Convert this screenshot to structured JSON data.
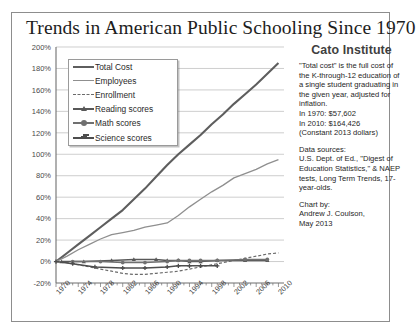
{
  "title": "Trends in American Public Schooling Since 1970",
  "sidebar": {
    "org": "Cato Institute",
    "definition": "\"Total cost\" is the full cost of the K-through-12 education of a single student graduating in the given year, adjusted for inflation.",
    "cost_1970": "In 1970:   $57,602",
    "cost_2010": "In 2010:  $164,426",
    "constant_note": "(Constant 2013 dollars)",
    "sources_label": "Data sources:",
    "sources_text": "U.S. Dept. of Ed., \"Digest of Education Statistics,\" & NAEP tests, Long Term Trends, 17-year-olds.",
    "chartby_label": "Chart by:",
    "author": "Andrew J. Coulson,",
    "date": "May 2013"
  },
  "chart_data": {
    "type": "line",
    "title": "Trends in American Public Schooling Since 1970",
    "xlabel": "",
    "ylabel": "",
    "xlim": [
      1970,
      2011
    ],
    "ylim": [
      -20,
      200
    ],
    "ytick_step": 20,
    "grid": true,
    "legend_position": "upper-left-inside",
    "ytick_labels": [
      "200%",
      "180%",
      "160%",
      "140%",
      "120%",
      "100%",
      "80%",
      "60%",
      "40%",
      "20%",
      "0%",
      "-20%"
    ],
    "ytick_values": [
      200,
      180,
      160,
      140,
      120,
      100,
      80,
      60,
      40,
      20,
      0,
      -20
    ],
    "xtick_labels": [
      "1970",
      "1974",
      "1978",
      "1982",
      "1986",
      "1990",
      "1994",
      "1998",
      "2002",
      "2006",
      "2010"
    ],
    "xtick_values": [
      1970,
      1974,
      1978,
      1982,
      1986,
      1990,
      1994,
      1998,
      2002,
      2006,
      2010
    ],
    "series": [
      {
        "name": "Total Cost",
        "color": "#5e5e5e",
        "width": 2.1,
        "dash": "",
        "marker": "none",
        "x": [
          1970,
          1972,
          1974,
          1976,
          1978,
          1980,
          1982,
          1984,
          1986,
          1988,
          1990,
          1992,
          1994,
          1996,
          1998,
          2000,
          2002,
          2004,
          2006,
          2008,
          2010
        ],
        "values": [
          0,
          8,
          16,
          24,
          32,
          40,
          48,
          58,
          68,
          79,
          90,
          100,
          109,
          118,
          128,
          137,
          147,
          156,
          165,
          175,
          185
        ]
      },
      {
        "name": "Employees",
        "color": "#8f8f8f",
        "width": 1.3,
        "dash": "",
        "marker": "none",
        "x": [
          1970,
          1972,
          1974,
          1976,
          1978,
          1980,
          1982,
          1984,
          1986,
          1988,
          1990,
          1992,
          1994,
          1996,
          1998,
          2000,
          2002,
          2004,
          2006,
          2008,
          2010
        ],
        "values": [
          0,
          5,
          11,
          16,
          21,
          25,
          27,
          29,
          32,
          34,
          36,
          43,
          51,
          58,
          65,
          71,
          78,
          82,
          86,
          91,
          95
        ]
      },
      {
        "name": "Enrollment",
        "color": "#6a6a6a",
        "width": 1.2,
        "dash": "3,2",
        "marker": "none",
        "x": [
          1970,
          1972,
          1974,
          1976,
          1978,
          1980,
          1982,
          1984,
          1986,
          1988,
          1990,
          1992,
          1994,
          1996,
          1998,
          2000,
          2002,
          2004,
          2006,
          2008,
          2010
        ],
        "values": [
          0,
          -1,
          -3,
          -5,
          -7,
          -9,
          -11,
          -12,
          -12,
          -11,
          -10,
          -9,
          -7,
          -5,
          -3,
          -1,
          1,
          3,
          5,
          7,
          8
        ]
      },
      {
        "name": "Reading scores",
        "color": "#585858",
        "width": 1.5,
        "dash": "",
        "marker": "triangle",
        "x": [
          1971,
          1975,
          1980,
          1984,
          1988,
          1990,
          1992,
          1994,
          1996,
          1999,
          2004,
          2008
        ],
        "values": [
          0,
          0,
          1,
          2,
          2,
          1,
          1,
          0,
          0,
          1,
          1,
          1
        ]
      },
      {
        "name": "Math scores",
        "color": "#707070",
        "width": 1.5,
        "dash": "",
        "marker": "circle",
        "x": [
          1973,
          1978,
          1982,
          1986,
          1990,
          1992,
          1994,
          1996,
          1999,
          2004,
          2008
        ],
        "values": [
          0,
          0,
          -1,
          -1,
          0,
          1,
          1,
          1,
          1,
          2,
          2
        ]
      },
      {
        "name": "Science scores",
        "color": "#4d4d4d",
        "width": 1.5,
        "dash": "",
        "marker": "cross",
        "x": [
          1970,
          1973,
          1977,
          1982,
          1986,
          1990,
          1992,
          1994,
          1996,
          1999
        ],
        "values": [
          0,
          -2,
          -5,
          -6,
          -6,
          -5,
          -4,
          -4,
          -4,
          -4
        ]
      }
    ]
  },
  "legend": [
    {
      "label": "Total Cost"
    },
    {
      "label": "Employees"
    },
    {
      "label": "Enrollment"
    },
    {
      "label": "Reading scores"
    },
    {
      "label": "Math scores"
    },
    {
      "label": "Science scores"
    }
  ]
}
